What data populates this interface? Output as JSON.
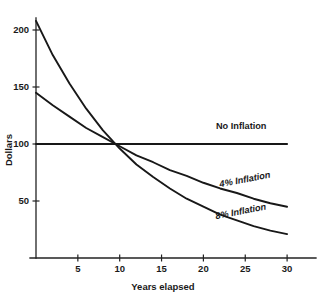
{
  "chart_data": {
    "type": "line",
    "title": "",
    "xlabel": "Years elapsed",
    "ylabel": "Dollars",
    "xlim": [
      0,
      33
    ],
    "ylim": [
      0,
      215
    ],
    "grid": false,
    "legend_position": "inline-right",
    "x_ticks": [
      5,
      10,
      15,
      20,
      25,
      30
    ],
    "x_tick_labels": [
      "5",
      "10",
      "15",
      "20",
      "25",
      "30"
    ],
    "y_ticks": [
      50,
      100,
      150,
      200
    ],
    "y_tick_labels": [
      "50",
      "100",
      "150",
      "200"
    ],
    "x": [
      0,
      2,
      4,
      6,
      8,
      10,
      12,
      14,
      16,
      18,
      20,
      22,
      24,
      26,
      28,
      30
    ],
    "series": [
      {
        "name": "No Inflation",
        "label": "No Inflation",
        "style": "straight",
        "values": [
          100,
          100,
          100,
          100,
          100,
          100,
          100,
          100,
          100,
          100,
          100,
          100,
          100,
          100,
          100,
          100
        ],
        "label_x": 21.5,
        "label_y": 113
      },
      {
        "name": "4% Inflation",
        "label": "4% Inflation",
        "style": "italic",
        "values": [
          145,
          134,
          124,
          114,
          106,
          98,
          90,
          84,
          77,
          72,
          66,
          61,
          57,
          52,
          48,
          45
        ],
        "label_x": 22.0,
        "label_y": 62
      },
      {
        "name": "8% Inflation",
        "label": "8% Inflation",
        "style": "italic",
        "values": [
          208,
          178,
          153,
          131,
          112,
          96,
          82,
          71,
          61,
          52,
          45,
          38,
          33,
          28,
          24,
          21
        ],
        "label_x": 21.5,
        "label_y": 34
      }
    ]
  },
  "colors": {
    "background": "#ffffff",
    "ink": "#181818",
    "axis": "#222222"
  }
}
